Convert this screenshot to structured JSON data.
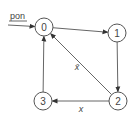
{
  "diagram": {
    "type": "state-machine",
    "input_label": "pon",
    "nodes": [
      {
        "id": "0",
        "label": "0"
      },
      {
        "id": "1",
        "label": "1"
      },
      {
        "id": "2",
        "label": "2"
      },
      {
        "id": "3",
        "label": "3"
      }
    ],
    "edges": [
      {
        "from": "start",
        "to": "0",
        "label": "pon"
      },
      {
        "from": "0",
        "to": "1",
        "label": ""
      },
      {
        "from": "1",
        "to": "2",
        "label": ""
      },
      {
        "from": "2",
        "to": "0",
        "label": "x̄"
      },
      {
        "from": "2",
        "to": "3",
        "label": "x"
      },
      {
        "from": "3",
        "to": "0",
        "label": ""
      }
    ],
    "colors": {
      "stroke": "#555555",
      "text": "#444444"
    }
  }
}
